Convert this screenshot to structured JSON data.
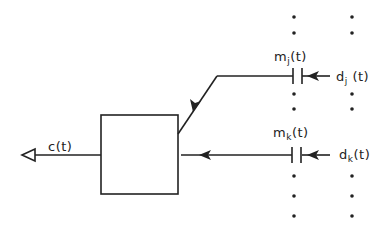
{
  "diagram": {
    "stroke_color": "#222222",
    "output_label": {
      "base": "c",
      "sub": "",
      "arg": "(t)"
    },
    "upper_input": {
      "m_label": {
        "base": "m",
        "sub": "j",
        "arg": "(t)"
      },
      "d_label": {
        "base": "d",
        "sub": "j",
        "arg": " (t)"
      }
    },
    "lower_input": {
      "m_label": {
        "base": "m",
        "sub": "k",
        "arg": "(t)"
      },
      "d_label": {
        "base": "d",
        "sub": "k",
        "arg": "(t)"
      }
    },
    "ellipsis_dots": {
      "columns_x": [
        294,
        352
      ],
      "rows_y": [
        17,
        33,
        94,
        109,
        176,
        196,
        216
      ]
    }
  }
}
